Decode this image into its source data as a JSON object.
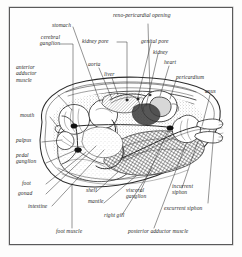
{
  "figure": {
    "kind": "anatomical-diagram",
    "style": "black-and-white line engraving with stipple and hatch shading",
    "frame_color": "#5a5a5a",
    "ink_color": "#2b2b2b",
    "paper_color": "#fefefe"
  },
  "labels": [
    {
      "id": "stomach",
      "text": "stomach"
    },
    {
      "id": "reno-pericardial-opening",
      "text": "reno-pericardial opening"
    },
    {
      "id": "cerebral-ganglion",
      "text": "cerebral\nganglion"
    },
    {
      "id": "kidney-pore",
      "text": "kidney pore"
    },
    {
      "id": "genital-pore",
      "text": "genital pore"
    },
    {
      "id": "kidney",
      "text": "kidney"
    },
    {
      "id": "aorta",
      "text": "aorta"
    },
    {
      "id": "liver",
      "text": "liver"
    },
    {
      "id": "heart",
      "text": "heart"
    },
    {
      "id": "anterior-adductor-muscle",
      "text": "anterior\nadductor\nmuscle"
    },
    {
      "id": "pericardium",
      "text": "pericardium"
    },
    {
      "id": "anus",
      "text": "anus"
    },
    {
      "id": "mouth",
      "text": "mouth"
    },
    {
      "id": "palpus",
      "text": "palpus"
    },
    {
      "id": "pedal-ganglion",
      "text": "pedal\nganglion"
    },
    {
      "id": "foot",
      "text": "foot"
    },
    {
      "id": "gonad",
      "text": "gonad"
    },
    {
      "id": "shell",
      "text": "shell"
    },
    {
      "id": "mantle",
      "text": "mantle"
    },
    {
      "id": "visceral-ganglion",
      "text": "visceral\nganglion"
    },
    {
      "id": "incurrent-siphon",
      "text": "incurrent\nsiphon"
    },
    {
      "id": "excurrent-siphon",
      "text": "excurrent siphon"
    },
    {
      "id": "intestine",
      "text": "intestine"
    },
    {
      "id": "right-gill",
      "text": "right gill"
    },
    {
      "id": "foot-muscle",
      "text": "foot muscle"
    },
    {
      "id": "posterior-adductor-muscle",
      "text": "posterior adductor muscle"
    }
  ]
}
